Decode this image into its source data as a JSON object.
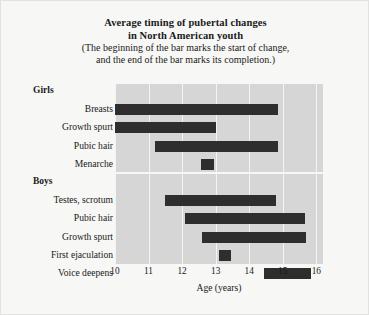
{
  "figure": {
    "title_line1": "Average timing of pubertal changes",
    "title_line2": "in North American youth",
    "subtitle_line1": "(The beginning of the bar marks the start of change,",
    "subtitle_line2": "and the end of the bar marks its completion.)"
  },
  "colors": {
    "bar": "#2e2e2e",
    "plot_background": "#d6d6d6",
    "page_background": "#f7f7f5",
    "gridline": "#f4f4f2",
    "text": "#1a1a1a"
  },
  "chart_data": {
    "type": "bar",
    "orientation": "horizontal",
    "title": "Average timing of pubertal changes in North American youth",
    "subtitle": "(The beginning of the bar marks the start of change, and the end of the bar marks its completion.)",
    "xlabel": "Age (years)",
    "ylabel": "",
    "xlim": [
      10,
      16.2
    ],
    "ticks": [
      10,
      11,
      12,
      13,
      14,
      15,
      16
    ],
    "tick_labels": [
      "10",
      "11",
      "12",
      "13",
      "14",
      "15",
      "16"
    ],
    "grid": true,
    "legend": "none",
    "groups": [
      {
        "name": "Girls",
        "items": [
          {
            "label": "Breasts",
            "start": 10.0,
            "end": 14.85
          },
          {
            "label": "Growth spurt",
            "start": 10.0,
            "end": 13.0
          },
          {
            "label": "Pubic hair",
            "start": 11.2,
            "end": 14.85
          },
          {
            "label": "Menarche",
            "start": 12.55,
            "end": 12.95
          }
        ]
      },
      {
        "name": "Boys",
        "items": [
          {
            "label": "Testes, scrotum",
            "start": 11.5,
            "end": 14.8
          },
          {
            "label": "Pubic hair",
            "start": 12.1,
            "end": 15.65
          },
          {
            "label": "Growth spurt",
            "start": 12.6,
            "end": 15.7
          },
          {
            "label": "First ejaculation",
            "start": 13.1,
            "end": 13.45
          },
          {
            "label": "Voice deepens",
            "start": 14.45,
            "end": 15.85
          }
        ]
      }
    ]
  }
}
